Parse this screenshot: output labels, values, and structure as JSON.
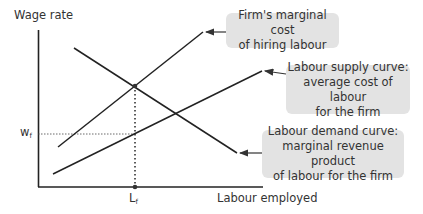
{
  "axes": {
    "y_label": "Wage rate",
    "x_label": "Labour employed",
    "w_tick": "w",
    "w_sub": "f",
    "l_tick": "L",
    "l_sub": "f"
  },
  "curves": [
    {
      "id": "marginal-cost",
      "name": "Firm's marginal cost of hiring labour"
    },
    {
      "id": "labour-supply",
      "name": "Labour supply curve: average cost of labour for the firm"
    },
    {
      "id": "labour-demand",
      "name": "Labour demand curve: marginal revenue product of labour for the firm"
    }
  ],
  "callouts": {
    "marginal_cost": [
      "Firm's marginal cost",
      "of hiring labour"
    ],
    "supply": [
      "Labour supply curve:",
      "average cost of labour",
      "for the firm"
    ],
    "demand": [
      "Labour demand curve:",
      "marginal revenue product",
      "of labour for the firm"
    ]
  },
  "colors": {
    "line": "#222222",
    "box_fill": "#e3e3e3",
    "text": "#333333"
  }
}
